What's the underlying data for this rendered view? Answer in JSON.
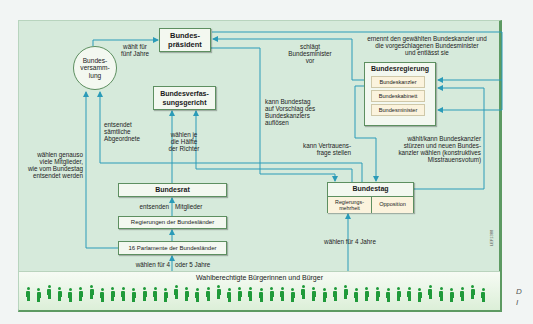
{
  "diagram": {
    "colors": {
      "background": "#d6eadb",
      "box_fill": "#f3f8f0",
      "box_border": "#5d8f60",
      "arrow": "#2a9bb8",
      "citizens": "#1f9a3a",
      "sub_box_fill": "#fbf3dd"
    },
    "nodes": {
      "bundespraesident": {
        "line1": "Bundes-",
        "line2": "präsident"
      },
      "bundesversammlung": {
        "line1": "Bundes-",
        "line2": "versamm-",
        "line3": "lung"
      },
      "bundesverfassungsgericht": {
        "line1": "Bundesverfas-",
        "line2": "sungsgericht"
      },
      "bundesregierung": {
        "title": "Bundesregierung",
        "items": [
          "Bundeskanzler",
          "Bundeskabinett",
          "Bundesminister"
        ]
      },
      "bundesrat": {
        "label": "Bundesrat"
      },
      "regierungen_laender": {
        "label": "Regierungen der Bundesländer"
      },
      "parlamente_laender": {
        "label": "16 Parlamente der Bundesländer"
      },
      "bundestag": {
        "title": "Bundestag",
        "sub": [
          {
            "line1": "Regierungs-",
            "line2": "mehrheit"
          },
          {
            "label": "Opposition"
          }
        ]
      },
      "citizens": {
        "label": "Wahlberechtigte Bürgerinnen und Bürger",
        "figure_count": 44
      }
    },
    "edge_labels": {
      "waehlt_fuenf_jahre": {
        "line1": "wählt für",
        "line2": "fünf Jahre"
      },
      "schlaegt_minister": {
        "line1": "schlägt",
        "line2": "Bundesminister",
        "line3": "vor"
      },
      "ernennt": {
        "line1": "ernennt den gewählten Bundeskanzler und",
        "line2": "die vorgeschlagenen Bundesminister",
        "line3": "und entlässt sie"
      },
      "entsendet_abgeordnete": {
        "line1": "entsendet",
        "line2": "sämtliche",
        "line3": "Abgeordnete"
      },
      "waehlen_haelfte": {
        "line1": "wählen je",
        "line2": "die Hälfte",
        "line3": "der Richter"
      },
      "aufloesen": {
        "line1": "kann Bundestag",
        "line2": "auf Vorschlag des",
        "line3": "Bundeskanzlers",
        "line4": "auflösen"
      },
      "vertrauensfrage": {
        "line1": "kann Vertrauens-",
        "line2": "frage stellen"
      },
      "misstrauensvotum": {
        "line1": "wählt/kann Bundeskanzler",
        "line2": "stürzen und neuen Bundes-",
        "line3": "kanzler wählen (konstruktives",
        "line4": "Misstrauensvotum)"
      },
      "waehlen_genauso": {
        "line1": "wählen genauso",
        "line2": "viele Mitglieder,",
        "line3": "wie vom Bundestag",
        "line4": "entsendet werden"
      },
      "entsenden": "entsenden",
      "mitglieder": "Mitglieder",
      "waehlen_4": "wählen für 4",
      "oder_5": "oder 5 Jahre",
      "waehlen_4_jahre": "wählen für 4 Jahre"
    },
    "credit": "LEF1388",
    "side_note": {
      "line1": "D",
      "line2": "I"
    }
  }
}
